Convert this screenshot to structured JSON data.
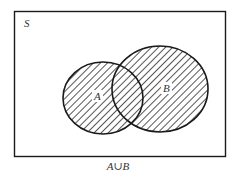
{
  "diagram": {
    "type": "venn",
    "universe_label": "S",
    "sets": [
      {
        "label": "A",
        "shaded": true
      },
      {
        "label": "B",
        "shaded": true
      }
    ],
    "caption": "A∪B",
    "shading": "diagonal-hatch",
    "colors": {
      "stroke": "#1a1a1a",
      "hatch": "#2a2a2a",
      "background": "#ffffff",
      "text": "#333333"
    }
  }
}
